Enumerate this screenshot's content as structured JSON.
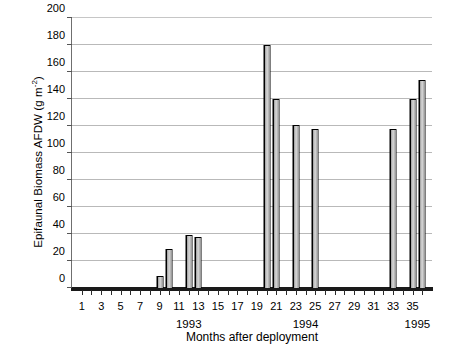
{
  "chart_data": {
    "type": "bar",
    "title": "",
    "xlabel": "Months after deployment",
    "ylabel": "Epifaunal Biomass AFDW (g m-2)",
    "ylabel_main": "Epifaunal Biomass AFDW (g m",
    "ylabel_exponent": "-2",
    "ylabel_close": ")",
    "xlim": [
      0,
      37
    ],
    "ylim": [
      0,
      200
    ],
    "ytick_values": [
      0,
      20,
      40,
      60,
      80,
      100,
      120,
      140,
      160,
      180,
      200
    ],
    "ytick_labels": [
      "0",
      "20",
      "40",
      "60",
      "80",
      "100",
      "120",
      "140",
      "160",
      "180",
      "200"
    ],
    "xtick_values": [
      1,
      3,
      5,
      7,
      9,
      11,
      13,
      15,
      17,
      19,
      21,
      23,
      25,
      27,
      29,
      31,
      33,
      35
    ],
    "xtick_labels": [
      "1",
      "3",
      "5",
      "7",
      "9",
      "11",
      "13",
      "15",
      "17",
      "19",
      "21",
      "23",
      "25",
      "27",
      "29",
      "31",
      "33",
      "35"
    ],
    "xtick_minor_values": [
      2,
      4,
      6,
      8,
      10,
      12,
      14,
      16,
      18,
      20,
      22,
      24,
      26,
      28,
      30,
      32,
      34,
      36
    ],
    "grid": "horizontal",
    "legend": "none",
    "x": [
      9,
      10,
      12,
      13,
      20,
      21,
      23,
      25,
      33,
      35,
      36
    ],
    "values": [
      9,
      29,
      39,
      38,
      180,
      140,
      121,
      118,
      118,
      140,
      154
    ],
    "bars": [
      {
        "month": 9,
        "value": 9
      },
      {
        "month": 10,
        "value": 29
      },
      {
        "month": 12,
        "value": 39
      },
      {
        "month": 13,
        "value": 38
      },
      {
        "month": 20,
        "value": 180
      },
      {
        "month": 21,
        "value": 140
      },
      {
        "month": 23,
        "value": 121
      },
      {
        "month": 25,
        "value": 118
      },
      {
        "month": 33,
        "value": 118
      },
      {
        "month": 35,
        "value": 140
      },
      {
        "month": 36,
        "value": 154
      }
    ],
    "annotations": [
      {
        "text": "1993",
        "month": 12
      },
      {
        "text": "1994",
        "month": 24
      },
      {
        "text": "1995",
        "month": 35.5
      }
    ]
  }
}
